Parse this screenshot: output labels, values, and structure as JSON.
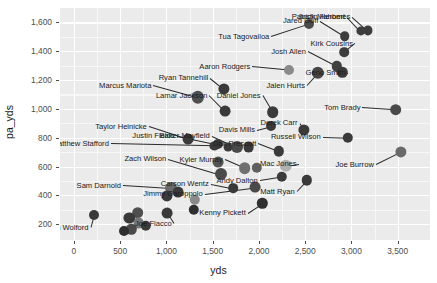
{
  "chart_data": {
    "type": "scatter",
    "title": "",
    "xlabel": "yds",
    "ylabel": "pa_yds",
    "xlim": [
      -150,
      3850
    ],
    "ylim": [
      90,
      1700
    ],
    "xticks": [
      "0",
      "500",
      "1,000",
      "1,500",
      "2,000",
      "2,500",
      "3,000",
      "3,500"
    ],
    "xtick_values": [
      0,
      500,
      1000,
      1500,
      2000,
      2500,
      3000,
      3500
    ],
    "yticks": [
      "200",
      "400",
      "600",
      "800",
      "1,000",
      "1,200",
      "1,400",
      "1,600"
    ],
    "ytick_values": [
      200,
      400,
      600,
      800,
      1000,
      1200,
      1400,
      1600
    ],
    "grid": true,
    "legend": "none",
    "point_color": "#3a3a3a",
    "panel_background": "#ebebeb",
    "gridline_color": "#ffffff",
    "points": [
      {
        "label": "Tua Tagovailoa",
        "x": 2540,
        "y": 1590,
        "lx": 2135,
        "ly": 1505,
        "anchor": "start",
        "shade": "#4a4a4a",
        "r": 5.0
      },
      {
        "label": "Jared Goff",
        "x": 2930,
        "y": 1505,
        "lx": 2665,
        "ly": 1610,
        "anchor": "start",
        "shade": "#3d3d3d",
        "r": 4.8
      },
      {
        "label": "Justin Herbert",
        "x": 3100,
        "y": 1540,
        "lx": 2955,
        "ly": 1640,
        "anchor": "start",
        "shade": "#3d3d3d",
        "r": 4.6
      },
      {
        "label": "Patrick Mahomes",
        "x": 3180,
        "y": 1545,
        "lx": 3010,
        "ly": 1640,
        "anchor": "start",
        "shade": "#3d3d3d",
        "r": 4.6
      },
      {
        "label": "Kirk Cousins",
        "x": 2925,
        "y": 1395,
        "lx": 3040,
        "ly": 1455,
        "anchor": "start",
        "shade": "#3d3d3d",
        "r": 4.8
      },
      {
        "label": "Josh Allen",
        "x": 2845,
        "y": 1295,
        "lx": 2530,
        "ly": 1400,
        "anchor": "start",
        "shade": "#404040",
        "r": 5.2
      },
      {
        "label": "Geno Smith",
        "x": 2900,
        "y": 1255,
        "lx": 2960,
        "ly": 1250,
        "anchor": "start",
        "shade": "#3a3a3a",
        "r": 5.2
      },
      {
        "label": "Jalen Hurts",
        "x": 2640,
        "y": 1250,
        "lx": 2520,
        "ly": 1165,
        "anchor": "start",
        "shade": "#454545",
        "r": 6.2
      },
      {
        "label": "Aaron Rodgers",
        "x": 2330,
        "y": 1270,
        "lx": 1930,
        "ly": 1295,
        "anchor": "start",
        "shade": "#8a8a8a",
        "r": 5.0
      },
      {
        "label": "Ryan Tannehill",
        "x": 1620,
        "y": 1140,
        "lx": 1475,
        "ly": 1215,
        "anchor": "start",
        "shade": "#3a3a3a",
        "r": 5.6
      },
      {
        "label": "Marcus Mariota",
        "x": 1340,
        "y": 1080,
        "lx": 860,
        "ly": 1165,
        "anchor": "start",
        "shade": "#4f4f4f",
        "r": 6.2
      },
      {
        "label": "Lamar Jackson",
        "x": 1635,
        "y": 985,
        "lx": 1465,
        "ly": 1095,
        "anchor": "start",
        "shade": "#3a3a3a",
        "r": 5.4
      },
      {
        "label": "Daniel Jones",
        "x": 2150,
        "y": 975,
        "lx": 2040,
        "ly": 1095,
        "anchor": "start",
        "shade": "#3a3a3a",
        "r": 5.8
      },
      {
        "label": "Davis Mills",
        "x": 2130,
        "y": 880,
        "lx": 1980,
        "ly": 855,
        "anchor": "start",
        "shade": "#3a3a3a",
        "r": 5.0
      },
      {
        "label": "Derek Carr",
        "x": 2490,
        "y": 855,
        "lx": 2440,
        "ly": 905,
        "anchor": "start",
        "shade": "#3a3a3a",
        "r": 5.6
      },
      {
        "label": "Tom Brady",
        "x": 3480,
        "y": 995,
        "lx": 3120,
        "ly": 1010,
        "anchor": "start",
        "shade": "#4a4a4a",
        "r": 5.8
      },
      {
        "label": "Russell Wilson",
        "x": 2960,
        "y": 800,
        "lx": 2690,
        "ly": 805,
        "anchor": "start",
        "shade": "#3a3a3a",
        "r": 5.2
      },
      {
        "label": "Joe Burrow",
        "x": 3535,
        "y": 700,
        "lx": 3265,
        "ly": 615,
        "anchor": "start",
        "shade": "#6a6a6a",
        "r": 5.6
      },
      {
        "label": "Taylor Heinicke",
        "x": 1235,
        "y": 790,
        "lx": 810,
        "ly": 880,
        "anchor": "start",
        "shade": "#3a3a3a",
        "r": 5.4
      },
      {
        "label": "Justin Fields",
        "x": 1560,
        "y": 755,
        "lx": 1110,
        "ly": 815,
        "anchor": "start",
        "shade": "#3a3a3a",
        "r": 5.0
      },
      {
        "label": "Matthew Stafford",
        "x": 1520,
        "y": 745,
        "lx": 400,
        "ly": 760,
        "anchor": "start",
        "shade": "#3a3a3a",
        "r": 4.6
      },
      {
        "label": "Baker Mayfield",
        "x": 1760,
        "y": 735,
        "lx": 1490,
        "ly": 815,
        "anchor": "start",
        "shade": "#4a4a4a",
        "r": 6.0
      },
      {
        "label": "Dak Prescott",
        "x": 2215,
        "y": 705,
        "lx": 1995,
        "ly": 760,
        "anchor": "start",
        "shade": "#3a3a3a",
        "r": 5.2
      },
      {
        "label": "Kyler Murray",
        "x": 1845,
        "y": 590,
        "lx": 1630,
        "ly": 650,
        "anchor": "start",
        "shade": "#6f6f6f",
        "r": 5.8
      },
      {
        "label": "Zach Wilson",
        "x": 1595,
        "y": 545,
        "lx": 1020,
        "ly": 655,
        "anchor": "start",
        "shade": "#4a4a4a",
        "r": 6.0
      },
      {
        "label": "Mac Jones",
        "x": 2290,
        "y": 605,
        "lx": 2430,
        "ly": 620,
        "anchor": "start",
        "shade": "#b0b0b0",
        "r": 6.2
      },
      {
        "label": "Carson Wentz",
        "x": 1720,
        "y": 450,
        "lx": 1480,
        "ly": 480,
        "anchor": "start",
        "shade": "#3a3a3a",
        "r": 4.8
      },
      {
        "label": "Andy Dalton",
        "x": 2250,
        "y": 530,
        "lx": 2010,
        "ly": 505,
        "anchor": "start",
        "shade": "#3a3a3a",
        "r": 5.2
      },
      {
        "label": "Matt Ryan",
        "x": 2520,
        "y": 505,
        "lx": 2410,
        "ly": 430,
        "anchor": "start",
        "shade": "#3a3a3a",
        "r": 5.2
      },
      {
        "label": "Jimmy Garoppolo",
        "x": 1960,
        "y": 455,
        "lx": 1415,
        "ly": 410,
        "anchor": "start",
        "shade": "#4a4a4a",
        "r": 5.4
      },
      {
        "label": "Kenny Pickett",
        "x": 2035,
        "y": 345,
        "lx": 1880,
        "ly": 280,
        "anchor": "start",
        "shade": "#2f2f2f",
        "r": 5.2
      },
      {
        "label": "Sam Darnold",
        "x": 1045,
        "y": 450,
        "lx": 530,
        "ly": 470,
        "anchor": "start",
        "shade": "#6a6a6a",
        "r": 6.0
      },
      {
        "label": "John Wolford",
        "x": 215,
        "y": 265,
        "lx": 180,
        "ly": 180,
        "anchor": "start",
        "shade": "#3a3a3a",
        "r": 5.0
      },
      {
        "label": "Joe Flacco",
        "x": 1010,
        "y": 275,
        "lx": 1080,
        "ly": 205,
        "anchor": "start",
        "shade": "#3a3a3a",
        "r": 5.4
      },
      {
        "label": "",
        "x": 1130,
        "y": 420,
        "lx": 0,
        "ly": 0,
        "anchor": "none",
        "shade": "#3a3a3a",
        "r": 5.4
      },
      {
        "label": "",
        "x": 1005,
        "y": 395,
        "lx": 0,
        "ly": 0,
        "anchor": "none",
        "shade": "#3a3a3a",
        "r": 5.6
      },
      {
        "label": "",
        "x": 1310,
        "y": 370,
        "lx": 0,
        "ly": 0,
        "anchor": "none",
        "shade": "#8a8a8a",
        "r": 5.2
      },
      {
        "label": "",
        "x": 1295,
        "y": 300,
        "lx": 0,
        "ly": 0,
        "anchor": "none",
        "shade": "#2f2f2f",
        "r": 5.2
      },
      {
        "label": "",
        "x": 1560,
        "y": 630,
        "lx": 0,
        "ly": 0,
        "anchor": "none",
        "shade": "#555555",
        "r": 5.4
      },
      {
        "label": "",
        "x": 690,
        "y": 280,
        "lx": 0,
        "ly": 0,
        "anchor": "none",
        "shade": "#4f4f4f",
        "r": 5.8
      },
      {
        "label": "",
        "x": 600,
        "y": 245,
        "lx": 0,
        "ly": 0,
        "anchor": "none",
        "shade": "#3a3a3a",
        "r": 5.6
      },
      {
        "label": "",
        "x": 700,
        "y": 205,
        "lx": 0,
        "ly": 0,
        "anchor": "none",
        "shade": "#777777",
        "r": 5.4
      },
      {
        "label": "",
        "x": 775,
        "y": 190,
        "lx": 0,
        "ly": 0,
        "anchor": "none",
        "shade": "#3a3a3a",
        "r": 5.2
      },
      {
        "label": "",
        "x": 620,
        "y": 165,
        "lx": 0,
        "ly": 0,
        "anchor": "none",
        "shade": "#4a4a4a",
        "r": 5.2
      },
      {
        "label": "",
        "x": 545,
        "y": 155,
        "lx": 0,
        "ly": 0,
        "anchor": "none",
        "shade": "#2f2f2f",
        "r": 5.0
      },
      {
        "label": "",
        "x": 1890,
        "y": 735,
        "lx": 0,
        "ly": 0,
        "anchor": "none",
        "shade": "#3a3a3a",
        "r": 5.4
      },
      {
        "label": "",
        "x": 1670,
        "y": 735,
        "lx": 0,
        "ly": 0,
        "anchor": "none",
        "shade": "#3a3a3a",
        "r": 4.4
      },
      {
        "label": "",
        "x": 1980,
        "y": 590,
        "lx": 0,
        "ly": 0,
        "anchor": "none",
        "shade": "#5f5f5f",
        "r": 5.2
      }
    ]
  }
}
